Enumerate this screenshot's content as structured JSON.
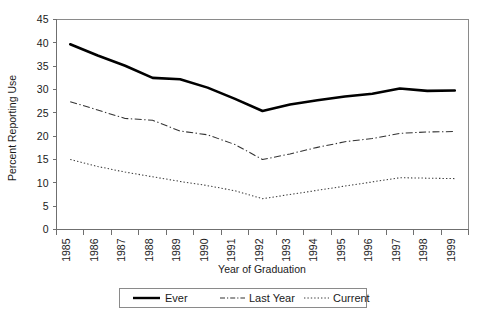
{
  "chart_data": {
    "type": "line",
    "title": "",
    "xlabel": "Year of Graduation",
    "ylabel": "Percent Reporting Use",
    "categories": [
      "1985",
      "1986",
      "1987",
      "1988",
      "1989",
      "1990",
      "1991",
      "1992",
      "1993",
      "1994",
      "1995",
      "1996",
      "1997",
      "1998",
      "1999"
    ],
    "x": [
      1985,
      1986,
      1987,
      1988,
      1989,
      1990,
      1991,
      1992,
      1993,
      1994,
      1995,
      1996,
      1997,
      1998,
      1999
    ],
    "ylim": [
      0,
      45
    ],
    "yticks": [
      0,
      5,
      10,
      15,
      20,
      25,
      30,
      35,
      40,
      45
    ],
    "ytick_labels": [
      "0",
      "5",
      "10",
      "15",
      "20",
      "25",
      "30",
      "35",
      "40",
      "45"
    ],
    "grid": false,
    "legend_position": "bottom",
    "series": [
      {
        "name": "Ever",
        "style": "solid-thick",
        "values": [
          39.7,
          37.3,
          35.1,
          32.5,
          32.2,
          30.4,
          28.0,
          25.4,
          26.8,
          27.7,
          28.5,
          29.1,
          30.2,
          29.7,
          29.8
        ]
      },
      {
        "name": "Last Year",
        "style": "dash-dot",
        "values": [
          27.4,
          25.6,
          23.8,
          23.4,
          21.1,
          20.3,
          18.2,
          15.0,
          16.2,
          17.6,
          18.8,
          19.5,
          20.6,
          20.9,
          21.0
        ]
      },
      {
        "name": "Current",
        "style": "dotted",
        "values": [
          15.0,
          13.5,
          12.3,
          11.3,
          10.3,
          9.4,
          8.3,
          6.6,
          7.5,
          8.4,
          9.3,
          10.2,
          11.1,
          11.0,
          10.9
        ]
      }
    ]
  },
  "legend": {
    "items": [
      {
        "label": "Ever"
      },
      {
        "label": "Last Year"
      },
      {
        "label": "Current"
      }
    ]
  },
  "colors": {
    "background": "#ffffff",
    "axis": "#6f6f6f",
    "frame": "#8a8a8a",
    "ever": "#000000",
    "last_year": "#333333",
    "current": "#3d3d3d",
    "text": "#1a1a1a"
  }
}
